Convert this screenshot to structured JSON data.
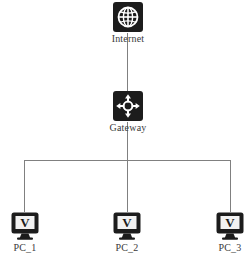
{
  "diagram": {
    "width": 251,
    "height": 265,
    "background_color": "#ffffff",
    "link_color": "#808080",
    "icon_color": "#1c1c1c",
    "icon_glyph_color": "#ffffff",
    "label_color": "#3a3a3a"
  },
  "nodes": {
    "internet": {
      "label": "Internet",
      "icon": "globe-icon",
      "x": 127,
      "y": 18
    },
    "gateway": {
      "label": "Gateway",
      "icon": "router-four-way-arrow-icon",
      "x": 127,
      "y": 107
    },
    "pc1": {
      "label": "PC_1",
      "icon": "monitor-v-icon",
      "x": 24,
      "y": 225
    },
    "pc2": {
      "label": "PC_2",
      "icon": "monitor-v-icon",
      "x": 127,
      "y": 225
    },
    "pc3": {
      "label": "PC_3",
      "icon": "monitor-v-icon",
      "x": 230,
      "y": 225
    }
  },
  "links": [
    {
      "from": "internet",
      "to": "gateway",
      "name": "link-internet-gateway"
    },
    {
      "from": "gateway",
      "to": "bus",
      "name": "link-gateway-bus"
    },
    {
      "from": "bus",
      "to": "pc1",
      "name": "link-bus-pc1"
    },
    {
      "from": "bus",
      "to": "pc2",
      "name": "link-bus-pc2"
    },
    {
      "from": "bus",
      "to": "pc3",
      "name": "link-bus-pc3"
    }
  ],
  "bus": {
    "name": "horizontal-bus-line",
    "y": 160,
    "x_start": 24,
    "x_end": 230
  }
}
